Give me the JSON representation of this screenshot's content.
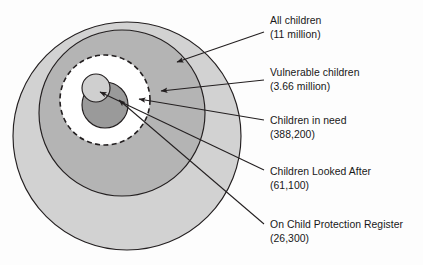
{
  "diagram": {
    "type": "nested-euler-circles",
    "title_visible": false,
    "background_color": "#fdfdfd",
    "outline_color": "#231f20",
    "regions": [
      {
        "key": "all_children",
        "label": "All children",
        "value": "(11 million)",
        "fill": "#d2d2d2",
        "stroke": "#231f20",
        "stroke_style": "solid",
        "cx": 127,
        "cy": 136,
        "r": 114
      },
      {
        "key": "children_in_need",
        "label": "Children in need",
        "value": "(388,200)",
        "fill": "#b4b4b4",
        "stroke": "#231f20",
        "stroke_style": "solid",
        "cx": 122,
        "cy": 113,
        "r": 83
      },
      {
        "key": "vulnerable_children",
        "label": "Vulnerable children",
        "value": "(3.66 million)",
        "fill": "#ffffff",
        "stroke": "#231f20",
        "stroke_style": "dashed",
        "cx": 105,
        "cy": 100,
        "r": 45
      },
      {
        "key": "on_child_protection_register",
        "label": "On Child Protection Register",
        "value": "(26,300)",
        "fill": "#9a9a9a",
        "stroke": "#231f20",
        "stroke_style": "solid",
        "cx": 105,
        "cy": 105,
        "r": 23
      },
      {
        "key": "children_looked_after",
        "label": "Children Looked After",
        "value": "(61,100)",
        "fill": "#cfcfcf",
        "stroke": "#231f20",
        "stroke_style": "solid",
        "cx": 96,
        "cy": 88,
        "r": 14
      }
    ]
  },
  "callouts": [
    {
      "key": "all_children",
      "label": "All children",
      "value": "(11 million)",
      "text_x": 270,
      "label_y": 24,
      "value_y": 38,
      "arrow_from_x": 264,
      "arrow_from_y": 32,
      "arrow_to_x": 177,
      "arrow_to_y": 62
    },
    {
      "key": "vulnerable_children",
      "label": "Vulnerable children",
      "value": "(3.66 million)",
      "text_x": 270,
      "label_y": 76,
      "value_y": 90,
      "arrow_from_x": 264,
      "arrow_from_y": 80,
      "arrow_to_x": 161,
      "arrow_to_y": 91
    },
    {
      "key": "children_in_need",
      "label": "Children in need",
      "value": "(388,200)",
      "text_x": 270,
      "label_y": 124,
      "value_y": 138,
      "arrow_from_x": 264,
      "arrow_from_y": 120,
      "arrow_to_x": 139,
      "arrow_to_y": 99
    },
    {
      "key": "children_looked_after",
      "label": "Children Looked After",
      "value": "(61,100)",
      "text_x": 270,
      "label_y": 175,
      "value_y": 189,
      "arrow_from_x": 264,
      "arrow_from_y": 170,
      "arrow_to_x": 100,
      "arrow_to_y": 92
    },
    {
      "key": "on_child_protection_register",
      "label": "On Child Protection Register",
      "value": "(26,300)",
      "text_x": 270,
      "label_y": 228,
      "value_y": 242,
      "arrow_from_x": 264,
      "arrow_from_y": 224,
      "arrow_to_x": 119,
      "arrow_to_y": 100
    }
  ]
}
